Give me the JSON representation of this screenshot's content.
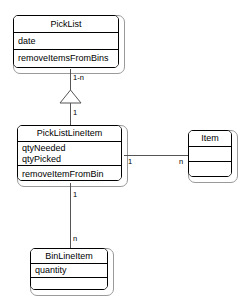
{
  "diagram": {
    "type": "uml-class-diagram",
    "background_color": "#ffffff",
    "line_color": "#555555",
    "border_color": "#000000",
    "frame_color": "#9a9a9a"
  },
  "classes": [
    {
      "id": "picklist",
      "name": "PickList",
      "attributes": [
        "date"
      ],
      "operations": [
        "removeItemsFromBins"
      ]
    },
    {
      "id": "picklistlineitem",
      "name": "PickListLineItem",
      "attributes": [
        "qtyNeeded",
        "qtyPicked"
      ],
      "operations": [
        "removeItemFromBin"
      ]
    },
    {
      "id": "item",
      "name": "Item",
      "attributes": [
        ""
      ],
      "operations": [
        ""
      ]
    },
    {
      "id": "binlineitem",
      "name": "BinLineItem",
      "attributes": [
        "quantity"
      ],
      "operations": [
        ""
      ]
    }
  ],
  "relationships": [
    {
      "id": "picklist-to-picklistlineitem",
      "from": "picklist",
      "to": "picklistlineitem",
      "kind": "aggregation-triangle",
      "source_multiplicity": "1-n",
      "target_multiplicity": "1"
    },
    {
      "id": "picklistlineitem-to-item",
      "from": "picklistlineitem",
      "to": "item",
      "kind": "association",
      "source_multiplicity": "1",
      "target_multiplicity": "n"
    },
    {
      "id": "picklistlineitem-to-binlineitem",
      "from": "picklistlineitem",
      "to": "binlineitem",
      "kind": "association",
      "source_multiplicity": "1",
      "target_multiplicity": "n"
    }
  ]
}
